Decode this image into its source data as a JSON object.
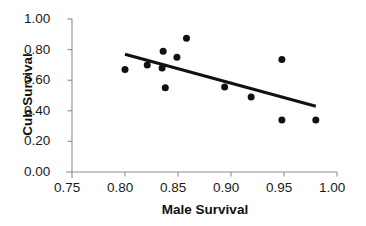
{
  "chart_data": {
    "type": "scatter",
    "title": "",
    "xlabel": "Male Survival",
    "ylabel": "Cub Survival",
    "xlim": [
      0.75,
      1.0
    ],
    "ylim": [
      0.0,
      1.0
    ],
    "xticks": [
      "0.75",
      "0.80",
      "0.85",
      "0.90",
      "0.95",
      "1.00"
    ],
    "xtick_values": [
      0.75,
      0.8,
      0.85,
      0.9,
      0.95,
      1.0
    ],
    "yticks": [
      "0.00",
      "0.20",
      "0.40",
      "0.60",
      "0.80",
      "1.00"
    ],
    "ytick_values": [
      0.0,
      0.2,
      0.4,
      0.6,
      0.8,
      1.0
    ],
    "grid": false,
    "legend": null,
    "marker": {
      "shape": "circle",
      "color": "#111111",
      "size_px": 7
    },
    "points": [
      {
        "x": 0.8,
        "y": 0.67
      },
      {
        "x": 0.821,
        "y": 0.7
      },
      {
        "x": 0.835,
        "y": 0.68
      },
      {
        "x": 0.836,
        "y": 0.79
      },
      {
        "x": 0.838,
        "y": 0.55
      },
      {
        "x": 0.849,
        "y": 0.75
      },
      {
        "x": 0.858,
        "y": 0.875
      },
      {
        "x": 0.894,
        "y": 0.555
      },
      {
        "x": 0.919,
        "y": 0.49
      },
      {
        "x": 0.948,
        "y": 0.735
      },
      {
        "x": 0.948,
        "y": 0.34
      },
      {
        "x": 0.98,
        "y": 0.34
      }
    ],
    "trendline": {
      "type": "linear",
      "color": "#111111",
      "width_px": 3,
      "x_start": 0.8,
      "y_start": 0.77,
      "x_end": 0.98,
      "y_end": 0.43
    },
    "axis_color": "#8d8d8d",
    "text_color": "#1a1a1a"
  }
}
